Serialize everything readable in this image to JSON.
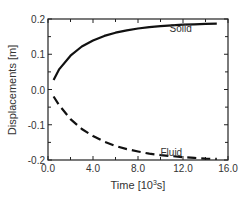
{
  "chart_data": {
    "type": "line",
    "title": "",
    "xlabel": "Time [10^3s]",
    "xlabel_main": "Time [10",
    "xlabel_sup": "3",
    "xlabel_tail": "s]",
    "ylabel": "Displacements [m]",
    "xlim": [
      0,
      16
    ],
    "ylim": [
      -0.2,
      0.2
    ],
    "x_ticks": [
      "0.0",
      "4.0",
      "8.0",
      "12.0",
      "16.0"
    ],
    "y_ticks": [
      "0.2",
      "0.1",
      "0.0",
      "-0.1",
      "-0.2"
    ],
    "grid": false,
    "legend": "inline annotations",
    "series": [
      {
        "name": "Solid",
        "style": "solid",
        "x": [
          0.5,
          1,
          2,
          3,
          4,
          5,
          6,
          7,
          8,
          9,
          10,
          11,
          12,
          13,
          14,
          15
        ],
        "values": [
          0.027,
          0.058,
          0.096,
          0.122,
          0.139,
          0.152,
          0.161,
          0.168,
          0.173,
          0.177,
          0.18,
          0.182,
          0.184,
          0.185,
          0.186,
          0.187
        ]
      },
      {
        "name": "Fluid",
        "style": "dashed",
        "x": [
          0.5,
          1,
          2,
          3,
          4,
          5,
          6,
          7,
          8,
          9,
          10,
          11,
          12,
          13,
          14,
          15
        ],
        "values": [
          -0.02,
          -0.045,
          -0.084,
          -0.112,
          -0.132,
          -0.148,
          -0.16,
          -0.169,
          -0.176,
          -0.182,
          -0.186,
          -0.189,
          -0.192,
          -0.194,
          -0.196,
          -0.197
        ]
      }
    ],
    "annotations": [
      {
        "text": "Solid",
        "x": 10.8,
        "y": 0.175
      },
      {
        "text": "Fluid",
        "x": 10.0,
        "y": -0.178
      }
    ]
  }
}
